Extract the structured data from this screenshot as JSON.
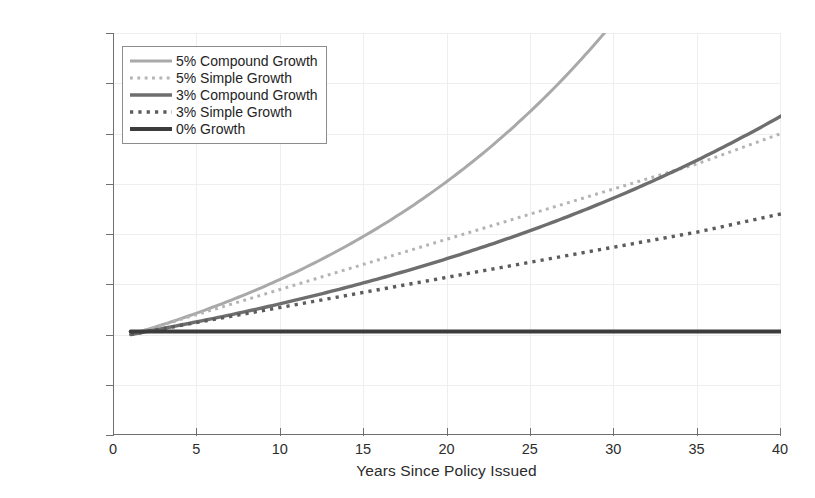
{
  "chart_data": {
    "type": "line",
    "title": "",
    "xlabel": "Years Since Policy Issued",
    "ylabel": "Annual Benefit Amount",
    "xlim": [
      0,
      40
    ],
    "ylim": [
      0,
      20000
    ],
    "xticks": [
      "0",
      "5",
      "10",
      "15",
      "20",
      "25",
      "30",
      "35",
      "40"
    ],
    "xtick_values": [
      0,
      5,
      10,
      15,
      20,
      25,
      30,
      35,
      40
    ],
    "yticks": [
      "$0",
      "$2,500",
      "$5,000",
      "$7,500",
      "$10,000",
      "$12,500",
      "$15,000",
      "$17,500",
      "$20,000"
    ],
    "ytick_values": [
      0,
      2500,
      5000,
      7500,
      10000,
      12500,
      15000,
      17500,
      20000
    ],
    "grid": true,
    "legend_position": "upper left",
    "x": [
      1,
      5,
      10,
      15,
      20,
      25,
      30,
      35,
      40
    ],
    "series": [
      {
        "name": "5% Compound Growth",
        "color": "#a9a9a9",
        "style": "solid",
        "width": 3.0,
        "clipped_at_top": true,
        "exit_x": 30.2,
        "values": [
          5000,
          6078,
          7757,
          9900,
          12636,
          16128,
          20585,
          26273,
          33533
        ]
      },
      {
        "name": "5% Simple Growth",
        "color": "#b4b4b4",
        "style": "dotted",
        "width": 3.0,
        "values": [
          5000,
          6000,
          7250,
          8500,
          9750,
          11000,
          12250,
          13500,
          15000
        ]
      },
      {
        "name": "3% Compound Growth",
        "color": "#6e6e6e",
        "style": "solid",
        "width": 3.4,
        "values": [
          5000,
          5637,
          6535,
          7576,
          8783,
          10181,
          11803,
          13684,
          15867
        ]
      },
      {
        "name": "3% Simple Growth",
        "color": "#5c5c5c",
        "style": "dotted",
        "width": 3.4,
        "values": [
          5000,
          5600,
          6350,
          7100,
          7850,
          8600,
          9350,
          10100,
          11000
        ]
      },
      {
        "name": "0% Growth",
        "color": "#3c3c3c",
        "style": "solid",
        "width": 4.0,
        "values": [
          5150,
          5150,
          5150,
          5150,
          5150,
          5150,
          5150,
          5150,
          5150
        ]
      }
    ]
  },
  "legend": {
    "items": [
      {
        "label": "5% Compound Growth",
        "color": "#a9a9a9",
        "style": "solid",
        "width": 3.0
      },
      {
        "label": "5% Simple Growth",
        "color": "#b4b4b4",
        "style": "dotted",
        "width": 3.0
      },
      {
        "label": "3% Compound Growth",
        "color": "#6e6e6e",
        "style": "solid",
        "width": 3.4
      },
      {
        "label": "3% Simple Growth",
        "color": "#5c5c5c",
        "style": "dotted",
        "width": 3.4
      },
      {
        "label": "0% Growth",
        "color": "#3c3c3c",
        "style": "solid",
        "width": 4.2
      }
    ]
  },
  "colors": {
    "axis": "#6f6f6f",
    "grid": "#eceff1",
    "text": "#2b2b2b",
    "background": "#ffffff"
  }
}
